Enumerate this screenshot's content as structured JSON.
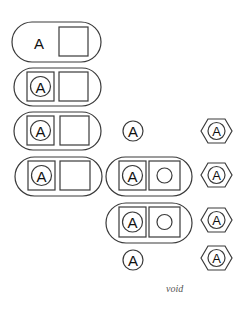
{
  "diagram": {
    "letter": "A",
    "caption": "void",
    "colors": {
      "stroke": "#3a3a3a",
      "text": "#111111",
      "background": "#ffffff"
    },
    "left_column": [
      {
        "id": "pill-1",
        "content": "plain letter + empty square"
      },
      {
        "id": "pill-2",
        "content": "boxed circled letter + empty square"
      },
      {
        "id": "pill-3",
        "content": "boxed circled letter + empty square"
      },
      {
        "id": "pill-4",
        "content": "boxed circled letter + empty square"
      }
    ],
    "middle_column": [
      {
        "id": "circle-a-top",
        "content": "circled letter"
      },
      {
        "id": "pill-5",
        "content": "boxed circled letter + boxed empty circle"
      },
      {
        "id": "pill-6",
        "content": "boxed circled letter + boxed empty circle"
      },
      {
        "id": "circle-a-bottom",
        "content": "circled letter"
      }
    ],
    "right_column": [
      {
        "id": "hex-1",
        "content": "hexagon with circled letter"
      },
      {
        "id": "hex-2",
        "content": "hexagon with circled letter"
      },
      {
        "id": "hex-3",
        "content": "hexagon with circled letter"
      },
      {
        "id": "hex-4",
        "content": "hexagon with circled letter"
      }
    ]
  }
}
